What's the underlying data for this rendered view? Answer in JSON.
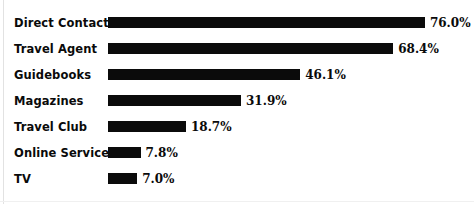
{
  "chart_data": {
    "type": "bar",
    "orientation": "horizontal",
    "title": "",
    "subtitle": "",
    "xlabel": "",
    "ylabel": "",
    "grid": false,
    "legend": null,
    "xlim": [
      0,
      80
    ],
    "value_suffix": "%",
    "bar_color": "#0b0b0b",
    "background_color": "#ffffff",
    "categories": [
      "Direct Contact",
      "Travel Agent",
      "Guidebooks",
      "Magazines",
      "Travel Club",
      "Online Service",
      "TV"
    ],
    "values": [
      76.0,
      68.4,
      46.1,
      31.9,
      18.7,
      7.8,
      7.0
    ],
    "value_labels": [
      "76.0%",
      "68.4%",
      "46.1%",
      "31.9%",
      "18.7%",
      "7.8%",
      "7.0%"
    ],
    "bars": [
      {
        "label": "Direct Contact",
        "value": 76.0,
        "value_label": "76.0%"
      },
      {
        "label": "Travel Agent",
        "value": 68.4,
        "value_label": "68.4%"
      },
      {
        "label": "Guidebooks",
        "value": 46.1,
        "value_label": "46.1%"
      },
      {
        "label": "Magazines",
        "value": 31.9,
        "value_label": "31.9%"
      },
      {
        "label": "Travel Club",
        "value": 18.7,
        "value_label": "18.7%"
      },
      {
        "label": "Online Service",
        "value": 7.8,
        "value_label": "7.8%"
      },
      {
        "label": "TV",
        "value": 7.0,
        "value_label": "7.0%"
      }
    ]
  },
  "layout": {
    "bar_origin_x": 108,
    "px_per_unit": 4.17,
    "row_height": 26,
    "first_row_top": 10,
    "bar_height": 11,
    "value_gap": 5
  }
}
